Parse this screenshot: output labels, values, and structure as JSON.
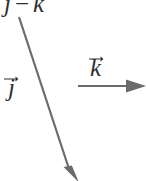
{
  "figure": {
    "title_expression": {
      "left_term": "j",
      "operator": "−",
      "right_term": "k"
    },
    "labels": {
      "vector_j": "j",
      "vector_k": "k"
    },
    "icons": {
      "vector_accent": "right-arrow-accent-icon",
      "diagonal_arrow": "diagonal-down-right-arrow-icon",
      "horizontal_arrow": "horizontal-right-arrow-icon"
    },
    "colors": {
      "background": "#ffffff",
      "ink": "#2e2e2e",
      "stroke": "#6b6b6b"
    },
    "geometry": {
      "diagonal_arrow": {
        "x1": 19,
        "y1": 17,
        "x2": 72,
        "y2": 179
      },
      "horizontal_arrow": {
        "x1": 78,
        "y1": 86,
        "x2": 146,
        "y2": 86
      }
    }
  }
}
